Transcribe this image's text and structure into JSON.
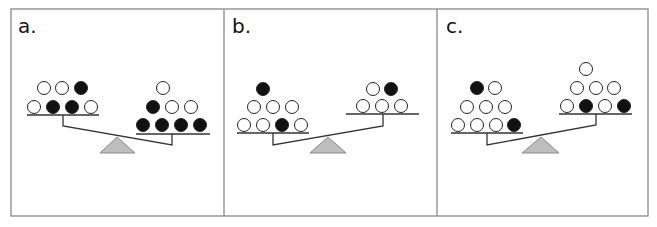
{
  "colors": {
    "frame": "#888888",
    "line": "#333333",
    "ball_black": "#111111",
    "ball_white": "#ffffff",
    "ball_stroke": "#222222",
    "fulcrum_fill": "#bdbdbd",
    "fulcrum_stroke": "#8a8a8a"
  },
  "panels": [
    {
      "label": "a.",
      "label_pos": [
        18,
        33
      ],
      "tilt": "right-down",
      "left_pan": {
        "line": [
          27,
          115,
          99
        ],
        "balls": [
          {
            "x": 44,
            "y": 88,
            "color": "white"
          },
          {
            "x": 62,
            "y": 88,
            "color": "white"
          },
          {
            "x": 81,
            "y": 88,
            "color": "black"
          },
          {
            "x": 34,
            "y": 107,
            "color": "white"
          },
          {
            "x": 53,
            "y": 107,
            "color": "black"
          },
          {
            "x": 72,
            "y": 107,
            "color": "black"
          },
          {
            "x": 91,
            "y": 107,
            "color": "white"
          }
        ]
      },
      "right_pan": {
        "line": [
          136,
          134,
          210
        ],
        "balls": [
          {
            "x": 163,
            "y": 88,
            "color": "white"
          },
          {
            "x": 153,
            "y": 107,
            "color": "black"
          },
          {
            "x": 172,
            "y": 107,
            "color": "white"
          },
          {
            "x": 191,
            "y": 107,
            "color": "white"
          },
          {
            "x": 143,
            "y": 125,
            "color": "black"
          },
          {
            "x": 162,
            "y": 125,
            "color": "black"
          },
          {
            "x": 181,
            "y": 125,
            "color": "black"
          },
          {
            "x": 200,
            "y": 125,
            "color": "black"
          }
        ]
      },
      "beam": [
        [
          63,
          115
        ],
        [
          63,
          126
        ],
        [
          172,
          145
        ],
        [
          172,
          134
        ]
      ],
      "fulcrum": [
        [
          117,
          137
        ],
        [
          100,
          153
        ],
        [
          135,
          153
        ]
      ]
    },
    {
      "label": "b.",
      "label_pos": [
        232,
        33
      ],
      "tilt": "left-down",
      "left_pan": {
        "line": [
          237,
          133,
          309
        ],
        "balls": [
          {
            "x": 263,
            "y": 89,
            "color": "black"
          },
          {
            "x": 254,
            "y": 107,
            "color": "white"
          },
          {
            "x": 273,
            "y": 107,
            "color": "white"
          },
          {
            "x": 292,
            "y": 107,
            "color": "white"
          },
          {
            "x": 244,
            "y": 125,
            "color": "white"
          },
          {
            "x": 263,
            "y": 125,
            "color": "white"
          },
          {
            "x": 282,
            "y": 125,
            "color": "black"
          },
          {
            "x": 301,
            "y": 125,
            "color": "white"
          }
        ]
      },
      "right_pan": {
        "line": [
          346,
          114,
          419
        ],
        "balls": [
          {
            "x": 373,
            "y": 89,
            "color": "white"
          },
          {
            "x": 391,
            "y": 89,
            "color": "black"
          },
          {
            "x": 363,
            "y": 106,
            "color": "white"
          },
          {
            "x": 382,
            "y": 106,
            "color": "white"
          },
          {
            "x": 401,
            "y": 106,
            "color": "white"
          }
        ]
      },
      "beam": [
        [
          273,
          133
        ],
        [
          273,
          145
        ],
        [
          383,
          126
        ],
        [
          383,
          114
        ]
      ],
      "fulcrum": [
        [
          328,
          137
        ],
        [
          310,
          153
        ],
        [
          346,
          153
        ]
      ]
    },
    {
      "label": "c.",
      "label_pos": [
        446,
        33
      ],
      "tilt": "left-down",
      "left_pan": {
        "line": [
          451,
          133,
          523
        ],
        "balls": [
          {
            "x": 477,
            "y": 88,
            "color": "black"
          },
          {
            "x": 495,
            "y": 88,
            "color": "white"
          },
          {
            "x": 467,
            "y": 107,
            "color": "white"
          },
          {
            "x": 486,
            "y": 107,
            "color": "white"
          },
          {
            "x": 505,
            "y": 107,
            "color": "white"
          },
          {
            "x": 458,
            "y": 125,
            "color": "white"
          },
          {
            "x": 477,
            "y": 125,
            "color": "white"
          },
          {
            "x": 496,
            "y": 125,
            "color": "white"
          },
          {
            "x": 514,
            "y": 125,
            "color": "black"
          }
        ]
      },
      "right_pan": {
        "line": [
          559,
          114,
          632
        ],
        "balls": [
          {
            "x": 586,
            "y": 69,
            "color": "white"
          },
          {
            "x": 577,
            "y": 88,
            "color": "white"
          },
          {
            "x": 596,
            "y": 88,
            "color": "white"
          },
          {
            "x": 614,
            "y": 88,
            "color": "white"
          },
          {
            "x": 567,
            "y": 106,
            "color": "white"
          },
          {
            "x": 586,
            "y": 106,
            "color": "black"
          },
          {
            "x": 605,
            "y": 106,
            "color": "white"
          },
          {
            "x": 624,
            "y": 106,
            "color": "black"
          }
        ]
      },
      "beam": [
        [
          487,
          133
        ],
        [
          487,
          145
        ],
        [
          596,
          125
        ],
        [
          596,
          114
        ]
      ],
      "fulcrum": [
        [
          541,
          137
        ],
        [
          522,
          153
        ],
        [
          559,
          153
        ]
      ]
    }
  ],
  "frame": {
    "x": 11,
    "y": 9,
    "w": 637,
    "h": 207,
    "dividers": [
      224,
      437
    ]
  }
}
